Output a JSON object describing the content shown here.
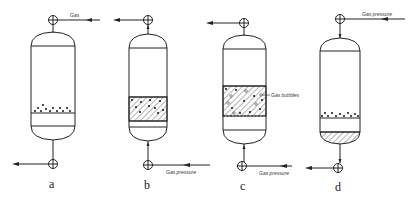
{
  "figure": {
    "panels": [
      {
        "id": "a",
        "caption": "a",
        "top_label": "Gas",
        "top_flow": "in",
        "bottom_flow": "out"
      },
      {
        "id": "b",
        "caption": "b",
        "bottom_label": "Gas pressure",
        "top_flow": "out",
        "bottom_flow": "in"
      },
      {
        "id": "c",
        "caption": "c",
        "side_label": "Gas bubbles",
        "bottom_label": "Gas pressure",
        "top_flow": "out",
        "bottom_flow": "in"
      },
      {
        "id": "d",
        "caption": "d",
        "top_label": "Gas pressure",
        "top_flow": "in",
        "bottom_flow": "out"
      }
    ],
    "colors": {
      "line": "#222222",
      "background": "#ffffff"
    }
  }
}
